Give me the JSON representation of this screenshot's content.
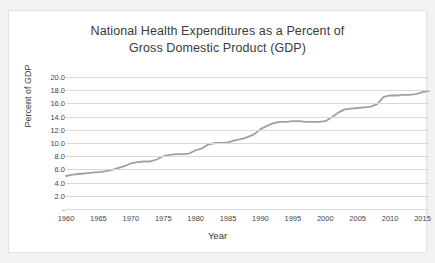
{
  "chart_data": {
    "type": "line",
    "title": "National Health Expenditures as a Percent of Gross Domestic Product (GDP)",
    "title_line1": "National Health Expenditures as a Percent of",
    "title_line2": "Gross Domestic Product (GDP)",
    "xlabel": "Year",
    "ylabel": "Percent of GDP",
    "xlim": [
      1960,
      2016
    ],
    "ylim": [
      0,
      20
    ],
    "grid": true,
    "legend": "none",
    "line_color": "#a0a0a0",
    "gridline_color": "#d8d8d8",
    "y_ticks": [
      "20.0",
      "18.0",
      "16.0",
      "14.0",
      "12.0",
      "10.0",
      "8.0",
      "6.0",
      "4.0",
      "2.0",
      "-"
    ],
    "y_tick_values": [
      20.0,
      18.0,
      16.0,
      14.0,
      12.0,
      10.0,
      8.0,
      6.0,
      4.0,
      2.0,
      0.0
    ],
    "x_ticks": [
      "1960",
      "1965",
      "1970",
      "1975",
      "1980",
      "1985",
      "1990",
      "1995",
      "2000",
      "2005",
      "2010",
      "2015"
    ],
    "x_tick_values": [
      1960,
      1965,
      1970,
      1975,
      1980,
      1985,
      1990,
      1995,
      2000,
      2005,
      2010,
      2015
    ],
    "series": [
      {
        "name": "National Health Expenditures as a Percent of GDP",
        "x": [
          1960,
          1961,
          1962,
          1963,
          1964,
          1965,
          1966,
          1967,
          1968,
          1969,
          1970,
          1971,
          1972,
          1973,
          1974,
          1975,
          1976,
          1977,
          1978,
          1979,
          1980,
          1981,
          1982,
          1983,
          1984,
          1985,
          1986,
          1987,
          1988,
          1989,
          1990,
          1991,
          1992,
          1993,
          1994,
          1995,
          1996,
          1997,
          1998,
          1999,
          2000,
          2001,
          2002,
          2003,
          2004,
          2005,
          2006,
          2007,
          2008,
          2009,
          2010,
          2011,
          2012,
          2013,
          2014,
          2015,
          2016
        ],
        "values": [
          5.0,
          5.2,
          5.3,
          5.4,
          5.5,
          5.6,
          5.7,
          5.9,
          6.2,
          6.5,
          6.9,
          7.1,
          7.2,
          7.2,
          7.5,
          8.0,
          8.2,
          8.3,
          8.3,
          8.4,
          8.9,
          9.2,
          9.8,
          10.0,
          10.0,
          10.1,
          10.4,
          10.6,
          10.9,
          11.3,
          12.1,
          12.6,
          13.0,
          13.2,
          13.2,
          13.3,
          13.3,
          13.2,
          13.2,
          13.2,
          13.3,
          13.9,
          14.6,
          15.1,
          15.2,
          15.3,
          15.4,
          15.5,
          15.9,
          17.0,
          17.2,
          17.2,
          17.3,
          17.3,
          17.4,
          17.7,
          17.9
        ]
      }
    ]
  }
}
